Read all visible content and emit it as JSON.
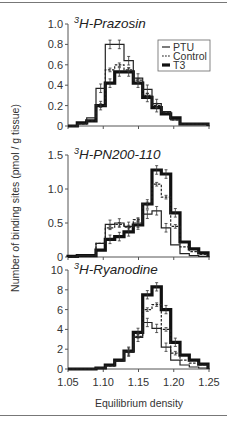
{
  "chart_data": {
    "type": "step-histogram",
    "xlabel": "Equilibrium density",
    "ylabel": "Number of binding sites (pmol / g tissue)",
    "x_ticks": [
      "1.05",
      "1.10",
      "1.15",
      "1.20",
      "1.25"
    ],
    "xlim": [
      1.05,
      1.25
    ],
    "bin_count": 15,
    "legend": [
      {
        "name": "PTU",
        "style": "thin solid"
      },
      {
        "name": "Control",
        "style": "dashed"
      },
      {
        "name": "T3",
        "style": "thick solid"
      }
    ],
    "panels": [
      {
        "title_sup": "3",
        "title": "H-Prazosin",
        "ylim": [
          0,
          1.0
        ],
        "y_ticks": [
          "0",
          "0.2",
          "0.4",
          "0.6",
          "0.8",
          "1.0"
        ],
        "series": [
          {
            "name": "PTU",
            "values": [
              0,
              0.02,
              0.08,
              0.37,
              0.8,
              0.8,
              0.64,
              0.47,
              0.36,
              0.22,
              0.14,
              0.06,
              0.02,
              0.02,
              0.02
            ]
          },
          {
            "name": "Control",
            "values": [
              0,
              0.02,
              0.05,
              0.2,
              0.55,
              0.6,
              0.55,
              0.45,
              0.3,
              0.2,
              0.13,
              0.06,
              0.02,
              0.02,
              0.02
            ]
          },
          {
            "name": "T3",
            "values": [
              0,
              0.03,
              0.05,
              0.2,
              0.42,
              0.53,
              0.53,
              0.42,
              0.28,
              0.18,
              0.12,
              0.08,
              0.02,
              0.02,
              0.02
            ]
          }
        ]
      },
      {
        "title_sup": "3",
        "title": "H-PN200-110",
        "ylim": [
          0,
          1.5
        ],
        "y_ticks": [
          "0",
          "0.5",
          "1.0",
          "1.5"
        ],
        "series": [
          {
            "name": "PTU",
            "values": [
              0,
              0.02,
              0.02,
              0.2,
              0.48,
              0.5,
              0.45,
              0.5,
              0.63,
              0.68,
              0.43,
              0.18,
              0.05,
              0.02,
              0.01
            ]
          },
          {
            "name": "Control",
            "values": [
              0,
              0.02,
              0.02,
              0.2,
              0.43,
              0.48,
              0.44,
              0.55,
              0.78,
              1.07,
              0.88,
              0.45,
              0.15,
              0.08,
              0.04
            ]
          },
          {
            "name": "T3",
            "values": [
              0.01,
              0.02,
              0.02,
              0.1,
              0.26,
              0.3,
              0.37,
              0.47,
              0.78,
              1.28,
              1.22,
              0.65,
              0.22,
              0.12,
              0.06
            ]
          }
        ]
      },
      {
        "title_sup": "3",
        "title": "H-Ryanodine",
        "ylim": [
          0,
          10
        ],
        "y_ticks": [
          "0",
          "2",
          "4",
          "6",
          "8",
          "10"
        ],
        "series": [
          {
            "name": "PTU",
            "values": [
              0,
              0,
              0,
              0.1,
              0.3,
              0.8,
              1.7,
              3.2,
              4.7,
              4.1,
              2.2,
              0.9,
              0.4,
              0.2,
              0.1
            ]
          },
          {
            "name": "Control",
            "values": [
              0,
              0,
              0,
              0.1,
              0.3,
              0.8,
              1.7,
              3.3,
              6.0,
              6.5,
              4.0,
              1.6,
              0.9,
              0.6,
              0.4
            ]
          },
          {
            "name": "T3",
            "values": [
              0,
              0,
              0,
              0.1,
              0.4,
              0.9,
              1.8,
              3.7,
              7.5,
              8.3,
              6.0,
              2.7,
              1.4,
              0.9,
              0.5
            ]
          }
        ]
      }
    ]
  }
}
